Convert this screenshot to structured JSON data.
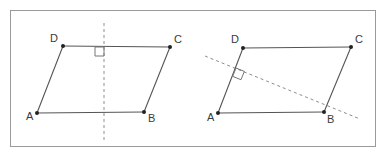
{
  "figure": {
    "background_color": "#ffffff",
    "frame": {
      "name": "outer-border",
      "x": 10,
      "y": 10,
      "width": 365,
      "height": 136,
      "stroke": "#9a9a9a",
      "stroke_width": 1,
      "fill": "none"
    },
    "style": {
      "solid_stroke": "#555555",
      "solid_stroke_width": 1.1,
      "dashed_stroke": "#8d8d8d",
      "dashed_stroke_width": 1,
      "dash_pattern": "3,3",
      "vertex_dot_color": "#222222",
      "vertex_dot_radius": 2,
      "label_color": "#3a3a3a",
      "label_font_size": 11,
      "right_angle_stroke": "#777777",
      "right_angle_size": 9
    },
    "shapes": [
      {
        "id": "left-parallelogram",
        "name": "parallelogram-abcd-left",
        "vertices": [
          {
            "id": "A",
            "label": "A",
            "x": 37,
            "y": 113,
            "label_x": 26,
            "label_y": 120
          },
          {
            "id": "B",
            "label": "B",
            "x": 144,
            "y": 112,
            "label_x": 148,
            "label_y": 122
          },
          {
            "id": "C",
            "label": "C",
            "x": 170,
            "y": 47,
            "label_x": 174,
            "label_y": 43
          },
          {
            "id": "D",
            "label": "D",
            "x": 63,
            "y": 46,
            "label_x": 50,
            "label_y": 42
          }
        ],
        "edges": [
          {
            "name": "edge-ab",
            "from": "A",
            "to": "B"
          },
          {
            "name": "edge-bc",
            "from": "B",
            "to": "C"
          },
          {
            "name": "edge-cd",
            "from": "C",
            "to": "D"
          },
          {
            "name": "edge-da",
            "from": "D",
            "to": "A"
          }
        ],
        "dashed_line": {
          "name": "vertical-altitude-line",
          "orientation": "vertical",
          "x1": 104,
          "y1": 23,
          "x2": 104,
          "y2": 141
        },
        "right_angle_marker": {
          "name": "right-angle-marker",
          "corner_x": 104,
          "corner_y": 47,
          "dir_x": -1,
          "dir_y": 1,
          "size": 9
        }
      },
      {
        "id": "right-parallelogram",
        "name": "parallelogram-abcd-right",
        "vertices": [
          {
            "id": "A",
            "label": "A",
            "x": 218,
            "y": 113,
            "label_x": 207,
            "label_y": 121
          },
          {
            "id": "B",
            "label": "B",
            "x": 324,
            "y": 112,
            "label_x": 327,
            "label_y": 123
          },
          {
            "id": "C",
            "label": "C",
            "x": 351,
            "y": 47,
            "label_x": 355,
            "label_y": 43
          },
          {
            "id": "D",
            "label": "D",
            "x": 243,
            "y": 48,
            "label_x": 231,
            "label_y": 43
          }
        ],
        "edges": [
          {
            "name": "edge-ab",
            "from": "A",
            "to": "B"
          },
          {
            "name": "edge-bc",
            "from": "B",
            "to": "C"
          },
          {
            "name": "edge-cd",
            "from": "C",
            "to": "D"
          },
          {
            "name": "edge-da",
            "from": "D",
            "to": "A"
          }
        ],
        "dashed_line": {
          "name": "oblique-altitude-line",
          "orientation": "oblique",
          "x1": 205,
          "y1": 56,
          "x2": 360,
          "y2": 119
        },
        "right_angle_marker": {
          "name": "right-angle-marker",
          "corner_x": 236,
          "corner_y": 68,
          "size": 9,
          "angle_deg": 22,
          "rotated": true
        }
      }
    ]
  }
}
